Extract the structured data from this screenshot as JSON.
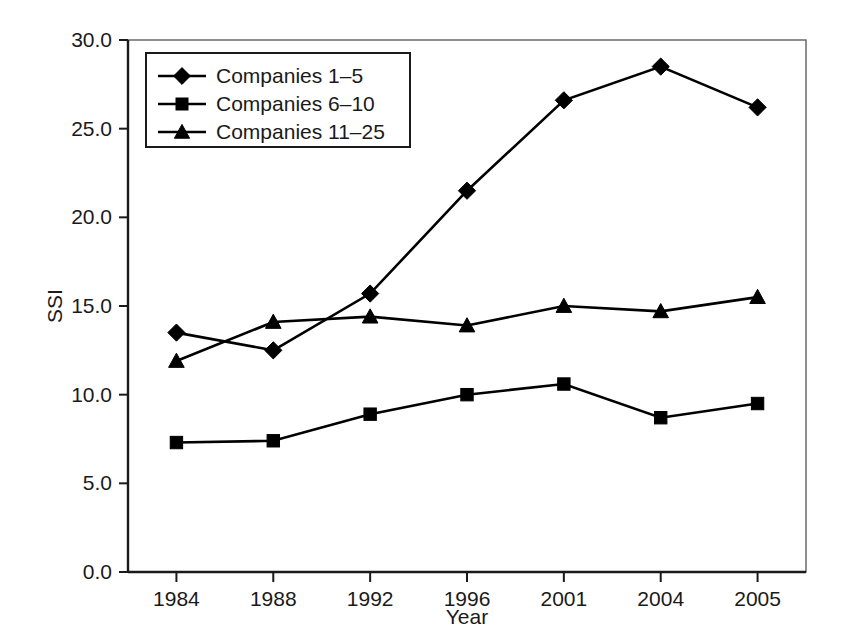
{
  "chart_data": {
    "type": "line",
    "title": "",
    "xlabel": "Year",
    "ylabel": "SSI",
    "categories": [
      "1984",
      "1988",
      "1992",
      "1996",
      "2001",
      "2004",
      "2005"
    ],
    "x_tick_labels": [
      "1984",
      "1988",
      "1992",
      "1996",
      "2001",
      "2004",
      "2005"
    ],
    "y_tick_labels": [
      "0.0",
      "5.0",
      "10.0",
      "15.0",
      "20.0",
      "25.0",
      "30.0"
    ],
    "y_tick_values": [
      0.0,
      5.0,
      10.0,
      15.0,
      20.0,
      25.0,
      30.0
    ],
    "ylim": [
      0.0,
      30.0
    ],
    "grid": false,
    "legend_position": "top-left-inside",
    "series": [
      {
        "name": "Companies 1–5",
        "marker": "diamond",
        "color": "#000000",
        "values": [
          13.5,
          12.5,
          15.7,
          21.5,
          26.6,
          28.5,
          26.2
        ]
      },
      {
        "name": "Companies 6–10",
        "marker": "square",
        "color": "#000000",
        "values": [
          7.3,
          7.4,
          8.9,
          10.0,
          10.6,
          8.7,
          9.5
        ]
      },
      {
        "name": "Companies 11–25",
        "marker": "triangle",
        "color": "#000000",
        "values": [
          11.9,
          14.1,
          14.4,
          13.9,
          15.0,
          14.7,
          15.5
        ]
      }
    ]
  }
}
